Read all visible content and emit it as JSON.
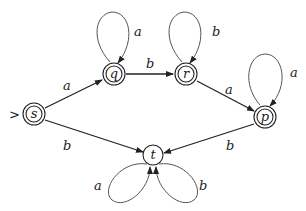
{
  "diagram": {
    "type": "finite-automaton",
    "start_marker": ">",
    "states": [
      {
        "id": "s",
        "label": "s",
        "accepting": true,
        "start": true
      },
      {
        "id": "q",
        "label": "q",
        "accepting": true,
        "start": false
      },
      {
        "id": "r",
        "label": "r",
        "accepting": true,
        "start": false
      },
      {
        "id": "p",
        "label": "p",
        "accepting": true,
        "start": false
      },
      {
        "id": "t",
        "label": "t",
        "accepting": false,
        "start": false
      }
    ],
    "transitions": [
      {
        "from": "s",
        "to": "q",
        "label": "a"
      },
      {
        "from": "s",
        "to": "t",
        "label": "b"
      },
      {
        "from": "q",
        "to": "q",
        "label": "a"
      },
      {
        "from": "q",
        "to": "r",
        "label": "b"
      },
      {
        "from": "r",
        "to": "r",
        "label": "b"
      },
      {
        "from": "r",
        "to": "p",
        "label": "a"
      },
      {
        "from": "p",
        "to": "p",
        "label": "a"
      },
      {
        "from": "p",
        "to": "t",
        "label": "b"
      },
      {
        "from": "t",
        "to": "t",
        "label": "a"
      },
      {
        "from": "t",
        "to": "t",
        "label": "b"
      }
    ]
  },
  "labels": {
    "start_marker": ">",
    "s": "s",
    "q": "q",
    "r": "r",
    "p": "p",
    "t": "t",
    "s_q": "a",
    "s_t": "b",
    "q_loop": "a",
    "q_r": "b",
    "r_loop": "b",
    "r_p": "a",
    "p_loop": "a",
    "p_t": "b",
    "t_loop_a": "a",
    "t_loop_b": "b"
  }
}
